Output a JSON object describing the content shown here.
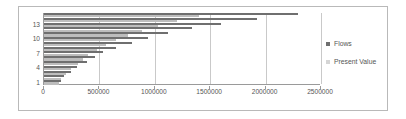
{
  "chart_data": {
    "type": "bar",
    "orientation": "horizontal",
    "title": "",
    "xlabel": "",
    "ylabel": "",
    "xlim": [
      0,
      2500000
    ],
    "ylim": [
      1,
      15
    ],
    "grid": true,
    "legend_position": "right",
    "categories": [
      "1",
      "2",
      "3",
      "4",
      "5",
      "6",
      "7",
      "8",
      "9",
      "10",
      "11",
      "12",
      "13",
      "14",
      "15"
    ],
    "ytick_labels": [
      "1",
      "4",
      "7",
      "10",
      "13"
    ],
    "xtick_labels": [
      "0",
      "500000",
      "1000000",
      "1500000",
      "2000000",
      "2500000"
    ],
    "xtick_values": [
      0,
      500000,
      1000000,
      1500000,
      2000000,
      2500000
    ],
    "series": [
      {
        "name": "Flows",
        "color": "#6f6f6f",
        "values": [
          150000,
          180000,
          240000,
          300000,
          390000,
          460000,
          530000,
          650000,
          790000,
          940000,
          1120000,
          1340000,
          1600000,
          1920000,
          2290000
        ]
      },
      {
        "name": "Present Value",
        "color": "#d5d5d5",
        "values": [
          135000,
          155000,
          200000,
          245000,
          310000,
          355000,
          400000,
          475000,
          560000,
          650000,
          755000,
          880000,
          1025000,
          1200000,
          1400000
        ]
      }
    ]
  },
  "legend": {
    "items": [
      {
        "label": "Flows",
        "marker": "square-swatch-dark"
      },
      {
        "label": "Present Value",
        "marker": "square-swatch-light"
      }
    ]
  }
}
